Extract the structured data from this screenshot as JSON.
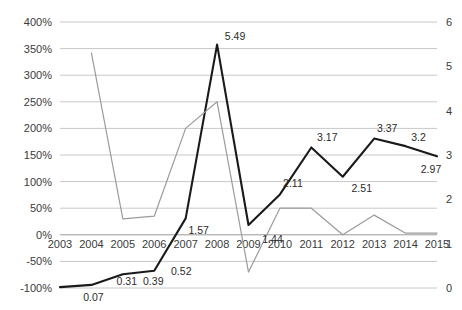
{
  "chart_data": {
    "type": "line",
    "title": "",
    "subtitle": "",
    "xlabel": "",
    "ylabel": "",
    "grid": true,
    "legend": "none",
    "x": [
      2003,
      2004,
      2005,
      2006,
      2007,
      2008,
      2009,
      2010,
      2011,
      2012,
      2013,
      2014,
      2015
    ],
    "categories": [
      "2003",
      "2004",
      "2005",
      "2006",
      "2007",
      "2008",
      "2009",
      "2010",
      "2011",
      "2012",
      "2013",
      "2014",
      "2015"
    ],
    "axes": {
      "left": {
        "label": "",
        "ylim": [
          -100,
          400
        ],
        "tick_step": 50,
        "tick_labels": [
          "400%",
          "350%",
          "300%",
          "250%",
          "200%",
          "150%",
          "100%",
          "50%",
          "0%",
          "-50%",
          "-100%"
        ],
        "tick_values": [
          400,
          350,
          300,
          250,
          200,
          150,
          100,
          50,
          0,
          -50,
          -100
        ],
        "unit": "percent"
      },
      "right": {
        "label": "",
        "ylim": [
          0,
          6
        ],
        "tick_step": 1,
        "tick_labels": [
          "6",
          "5",
          "4",
          "3",
          "2",
          "1",
          "0"
        ],
        "tick_values": [
          6,
          5,
          4,
          3,
          2,
          1,
          0
        ],
        "unit": "absolute"
      }
    },
    "series": [
      {
        "name": "value-series",
        "axis": "right",
        "color": "#1a1a1a",
        "style": "solid-thick",
        "values": [
          0.02,
          0.07,
          0.31,
          0.39,
          1.57,
          5.49,
          1.42,
          2.11,
          3.17,
          2.51,
          3.37,
          3.2,
          2.97
        ],
        "point_labels": [
          "",
          "0.07",
          "0.31",
          "0.39",
          "0.52",
          "1.57",
          "",
          "1.44",
          "2.11",
          "3.17",
          "2.51",
          "3.37",
          "3.2"
        ],
        "labels_rendered": [
          {
            "text": "0.07",
            "x": 2004,
            "value": 0.07
          },
          {
            "text": "0.31",
            "x": 2005,
            "value": 0.31
          },
          {
            "text": "0.39",
            "x": 2006,
            "value": 0.39
          },
          {
            "text": "0.52",
            "x": 2007,
            "value": 0.52
          },
          {
            "text": "1.57",
            "x": 2007,
            "value": 1.57
          },
          {
            "text": "5.49",
            "x": 2008,
            "value": 5.49
          },
          {
            "text": "1.44",
            "x": 2010,
            "value": 1.44
          },
          {
            "text": "2.11",
            "x": 2010,
            "value": 2.11
          },
          {
            "text": "3.17",
            "x": 2011,
            "value": 3.17
          },
          {
            "text": "2.51",
            "x": 2012,
            "value": 2.51
          },
          {
            "text": "3.37",
            "x": 2013,
            "value": 3.37
          },
          {
            "text": "3.2",
            "x": 2014,
            "value": 3.2
          },
          {
            "text": "2.97",
            "x": 2015,
            "value": 2.97
          }
        ]
      },
      {
        "name": "growth-rate-series",
        "axis": "left",
        "color": "#9b9b9b",
        "style": "solid-thin",
        "values": [
          null,
          342,
          30,
          35,
          200,
          250,
          -70,
          50,
          50,
          0,
          37,
          3,
          3
        ],
        "point_labels": [
          "",
          "",
          "",
          "",
          "",
          "",
          "",
          "",
          "",
          "",
          "",
          "",
          ""
        ]
      }
    ]
  },
  "labels": {
    "left_ticks": [
      "400%",
      "350%",
      "300%",
      "250%",
      "200%",
      "150%",
      "100%",
      "50%",
      "0%",
      "-50%",
      "-100%"
    ],
    "right_ticks": [
      "6",
      "5",
      "4",
      "3",
      "2",
      "1",
      "0"
    ],
    "x_ticks": [
      "2003",
      "2004",
      "2005",
      "2006",
      "2007",
      "2008",
      "2009",
      "2010",
      "2011",
      "2012",
      "2013",
      "2014",
      "2015"
    ],
    "point_labels": [
      "0.07",
      "0.31",
      "0.39",
      "0.52",
      "1.57",
      "5.49",
      "1.44",
      "2.11",
      "3.17",
      "2.51",
      "3.37",
      "3.2",
      "2.97"
    ]
  }
}
